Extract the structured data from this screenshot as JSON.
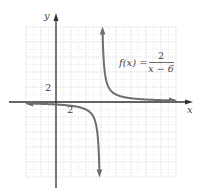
{
  "chart_data": {
    "type": "line",
    "title": "",
    "function_label": {
      "lhs": "f(x) =",
      "numerator": "2",
      "denominator": "x − 6"
    },
    "function": "f(x) = 2/(x - 6)",
    "xlabel": "x",
    "ylabel": "y",
    "xlim": [
      -4,
      16
    ],
    "ylim": [
      -10,
      10
    ],
    "grid": true,
    "grid_step": 2,
    "tick_labels": {
      "x": [
        {
          "value": 2,
          "label": "2"
        }
      ],
      "y": [
        {
          "value": 2,
          "label": "2"
        }
      ]
    },
    "asymptotes": {
      "vertical": 6,
      "horizontal": 0
    },
    "series": [
      {
        "name": "left branch",
        "x": [
          -4,
          -2,
          0,
          2,
          3,
          4,
          5,
          5.5,
          5.8
        ],
        "y": [
          -0.2,
          -0.25,
          -0.33,
          -0.5,
          -0.67,
          -1,
          -2,
          -4,
          -10
        ]
      },
      {
        "name": "right branch",
        "x": [
          6.2,
          6.5,
          7,
          8,
          9,
          10,
          12,
          14,
          16
        ],
        "y": [
          10,
          4,
          2,
          1,
          0.67,
          0.5,
          0.33,
          0.25,
          0.2
        ]
      }
    ],
    "colors": {
      "curve": "#6e6e6e",
      "axes": "#333333",
      "grid": "#c8c8c8"
    }
  }
}
